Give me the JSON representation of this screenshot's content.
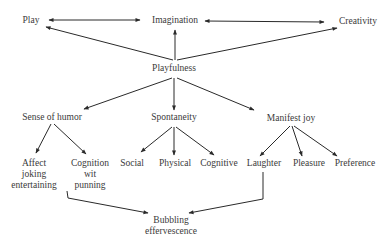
{
  "diagram": {
    "nodes": {
      "play": "Play",
      "imagination": "Imagination",
      "creativity": "Creativity",
      "playfulness": "Playfulness",
      "sense_of_humor": "Sense of humor",
      "spontaneity": "Spontaneity",
      "manifest_joy": "Manifest joy",
      "affect": [
        "Affect",
        "joking",
        "entertaining"
      ],
      "cognition": [
        "Cognition",
        "wit",
        "punning"
      ],
      "social": "Social",
      "physical": "Physical",
      "cognitive": "Cognitive",
      "laughter": "Laughter",
      "pleasure": "Pleasure",
      "preference": "Preference",
      "bubbling": [
        "Bubbling",
        "effervescence"
      ]
    },
    "edges": [
      {
        "from": "play",
        "to": "imagination",
        "type": "bidirectional"
      },
      {
        "from": "imagination",
        "to": "creativity",
        "type": "bidirectional"
      },
      {
        "from": "playfulness",
        "to": "play"
      },
      {
        "from": "playfulness",
        "to": "imagination"
      },
      {
        "from": "playfulness",
        "to": "creativity"
      },
      {
        "from": "playfulness",
        "to": "sense_of_humor"
      },
      {
        "from": "playfulness",
        "to": "spontaneity"
      },
      {
        "from": "playfulness",
        "to": "manifest_joy"
      },
      {
        "from": "sense_of_humor",
        "to": "affect"
      },
      {
        "from": "sense_of_humor",
        "to": "cognition"
      },
      {
        "from": "spontaneity",
        "to": "social"
      },
      {
        "from": "spontaneity",
        "to": "physical"
      },
      {
        "from": "spontaneity",
        "to": "cognitive"
      },
      {
        "from": "manifest_joy",
        "to": "laughter"
      },
      {
        "from": "manifest_joy",
        "to": "pleasure"
      },
      {
        "from": "manifest_joy",
        "to": "preference"
      },
      {
        "from": "affect",
        "to": "bubbling"
      },
      {
        "from": "laughter",
        "to": "bubbling"
      }
    ],
    "line_color": "#2a2a2a"
  }
}
